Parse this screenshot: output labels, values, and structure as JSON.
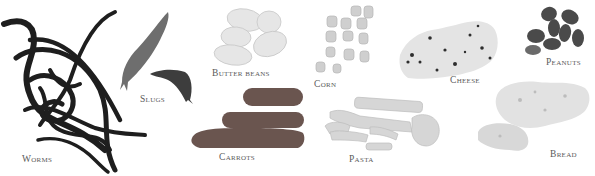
{
  "items": [
    {
      "id": "worms",
      "label": "Worms",
      "x": 22,
      "y": 154
    },
    {
      "id": "slugs",
      "label": "Slugs",
      "x": 140,
      "y": 94
    },
    {
      "id": "butter-beans",
      "label": "Butter beans",
      "x": 212,
      "y": 68
    },
    {
      "id": "carrots",
      "label": "Carrots",
      "x": 219,
      "y": 152
    },
    {
      "id": "corn",
      "label": "Corn",
      "x": 314,
      "y": 79
    },
    {
      "id": "cheese",
      "label": "Cheese",
      "x": 450,
      "y": 75
    },
    {
      "id": "peanuts",
      "label": "Peanuts",
      "x": 546,
      "y": 57
    },
    {
      "id": "pasta",
      "label": "Pasta",
      "x": 349,
      "y": 154
    },
    {
      "id": "bread",
      "label": "Bread",
      "x": 550,
      "y": 149
    }
  ],
  "colors": {
    "background": "#ffffff",
    "label": "#5a5a5a",
    "worm": "#1e1e1e",
    "slug": "#6e6e6e",
    "bean": "#e6e6e6",
    "carrot": "#6a5450",
    "corn": "#cfcfcf",
    "cheese": "#e4e4e4",
    "peanut": "#4a4a4a",
    "pasta": "#d6d6d6",
    "bread": "#e2e2e2"
  }
}
